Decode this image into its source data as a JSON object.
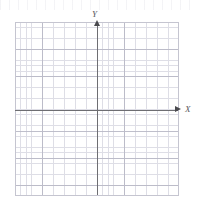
{
  "figure": {
    "title": "",
    "background_color": "#ffffff"
  },
  "axes": {
    "x": {
      "label": "X",
      "orientation": "horizontal",
      "arrow_direction": "right",
      "color": "#6e6e72"
    },
    "y": {
      "label": "Y",
      "orientation": "vertical",
      "arrow_direction": "up",
      "color": "#6e6e72"
    },
    "origin_label": ""
  },
  "grid": {
    "minor_color": "#d9d9e2",
    "major_color": "#b9b9c6",
    "border_color": "#c5c5d0",
    "minor_cells_x": 30,
    "minor_cells_y": 32,
    "major_every": 5
  },
  "chart_data": {
    "type": "scatter",
    "title": "",
    "subtitle": "",
    "xlabel": "X",
    "ylabel": "Y",
    "x": [],
    "y": [],
    "series": [],
    "annotations": [],
    "xlim": [
      -15,
      15
    ],
    "ylim": [
      -16,
      16
    ],
    "xticks": [],
    "yticks": [],
    "grid": true,
    "legend": false,
    "legend_position": "none"
  }
}
